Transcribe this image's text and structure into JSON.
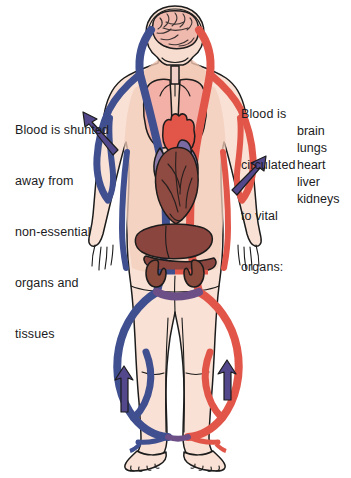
{
  "captions": {
    "left": {
      "name": "shunting-caption",
      "lines": [
        "Blood is shunted",
        "away from",
        "non-essential",
        "organs and",
        "tissues"
      ]
    },
    "right": {
      "name": "circulation-caption",
      "lines": [
        "Blood is",
        "circulated",
        "to vital",
        "organs:"
      ]
    }
  },
  "vital_organs": [
    "brain",
    "lungs",
    "heart",
    "liver",
    "kidneys"
  ],
  "labels": {
    "brain": "brain",
    "lungs": "lungs",
    "heart": "heart",
    "liver": "liver",
    "kidneys": "kidneys"
  },
  "colors": {
    "venous_blue": "#3f4f8f",
    "arterial_red": "#e2564a",
    "arrow_purple": "#54488c",
    "skin": "#f7ddcf",
    "skin_shadow": "#efc9b6",
    "brain_pink": "#f0b9ae",
    "lung_pink": "#f2b0a6",
    "heart_dark": "#8f4a41",
    "heart_red": "#e2564a",
    "heart_purple": "#8b7aa8",
    "liver_maroon": "#8a453f",
    "kidney_brown": "#8a4a3c",
    "outline": "#1c1c1c",
    "background": "#ffffff"
  },
  "arrows": [
    {
      "name": "arrow-left-arm",
      "direction": "up-left"
    },
    {
      "name": "arrow-right-arm",
      "direction": "up-right"
    },
    {
      "name": "arrow-left-leg",
      "direction": "up"
    },
    {
      "name": "arrow-right-leg",
      "direction": "up"
    }
  ],
  "vessels": [
    {
      "name": "vein-left-side",
      "type": "venous",
      "color": "#3f4f8f"
    },
    {
      "name": "artery-right-side",
      "type": "arterial",
      "color": "#e2564a"
    }
  ]
}
